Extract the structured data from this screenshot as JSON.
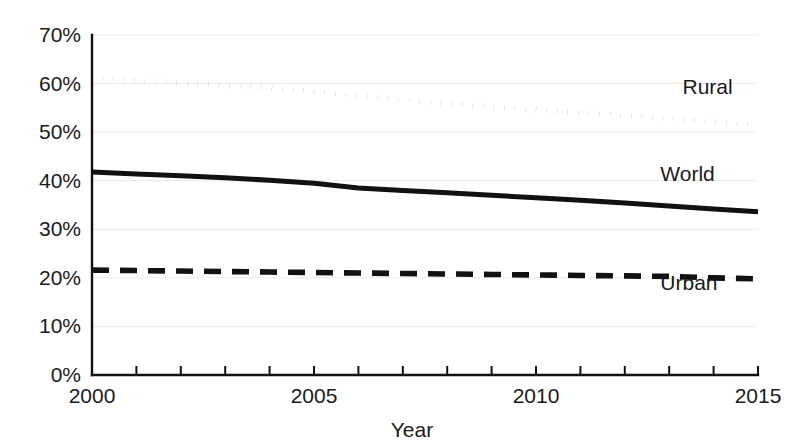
{
  "chart_data": {
    "type": "line",
    "title": "",
    "subtitle": "",
    "xlabel": "Year",
    "ylabel": "",
    "x": [
      2000,
      2001,
      2002,
      2003,
      2004,
      2005,
      2006,
      2007,
      2008,
      2009,
      2010,
      2011,
      2012,
      2013,
      2014,
      2015
    ],
    "xlim": [
      2000,
      2015
    ],
    "ylim": [
      0,
      70
    ],
    "grid": true,
    "legend_position": "inline-right",
    "x_tick_labels": [
      "2000",
      "2005",
      "2010",
      "2015"
    ],
    "x_tick_values": [
      2000,
      2005,
      2010,
      2015
    ],
    "x_minor_ticks": [
      2000,
      2001,
      2002,
      2003,
      2004,
      2005,
      2006,
      2007,
      2008,
      2009,
      2010,
      2011,
      2012,
      2013,
      2014,
      2015
    ],
    "y_tick_labels": [
      "0%",
      "10%",
      "20%",
      "30%",
      "40%",
      "50%",
      "60%",
      "70%"
    ],
    "y_tick_values": [
      0,
      10,
      20,
      30,
      40,
      50,
      60,
      70
    ],
    "y_unit": "%",
    "series": [
      {
        "name": "Rural",
        "style": "dotted",
        "color": "#111111",
        "values": [
          61.2,
          60.6,
          60.1,
          59.6,
          59.1,
          58.4,
          57.4,
          56.6,
          55.9,
          55.2,
          54.6,
          54.0,
          53.4,
          52.8,
          52.1,
          51.5
        ],
        "label_x": 2013.3,
        "label_y": 57.8
      },
      {
        "name": "World",
        "style": "solid",
        "color": "#111111",
        "values": [
          41.8,
          41.4,
          41.0,
          40.6,
          40.1,
          39.5,
          38.5,
          38.0,
          37.5,
          37.0,
          36.5,
          36.0,
          35.4,
          34.8,
          34.2,
          33.6
        ],
        "label_x": 2012.8,
        "label_y": 40.0
      },
      {
        "name": "Urban",
        "style": "dashed",
        "color": "#111111",
        "values": [
          21.6,
          21.5,
          21.4,
          21.3,
          21.2,
          21.1,
          21.0,
          20.9,
          20.8,
          20.7,
          20.6,
          20.5,
          20.4,
          20.3,
          20.0,
          19.8
        ],
        "label_x": 2012.8,
        "label_y": 17.6
      }
    ]
  },
  "axes": {
    "x_title": "Year"
  }
}
